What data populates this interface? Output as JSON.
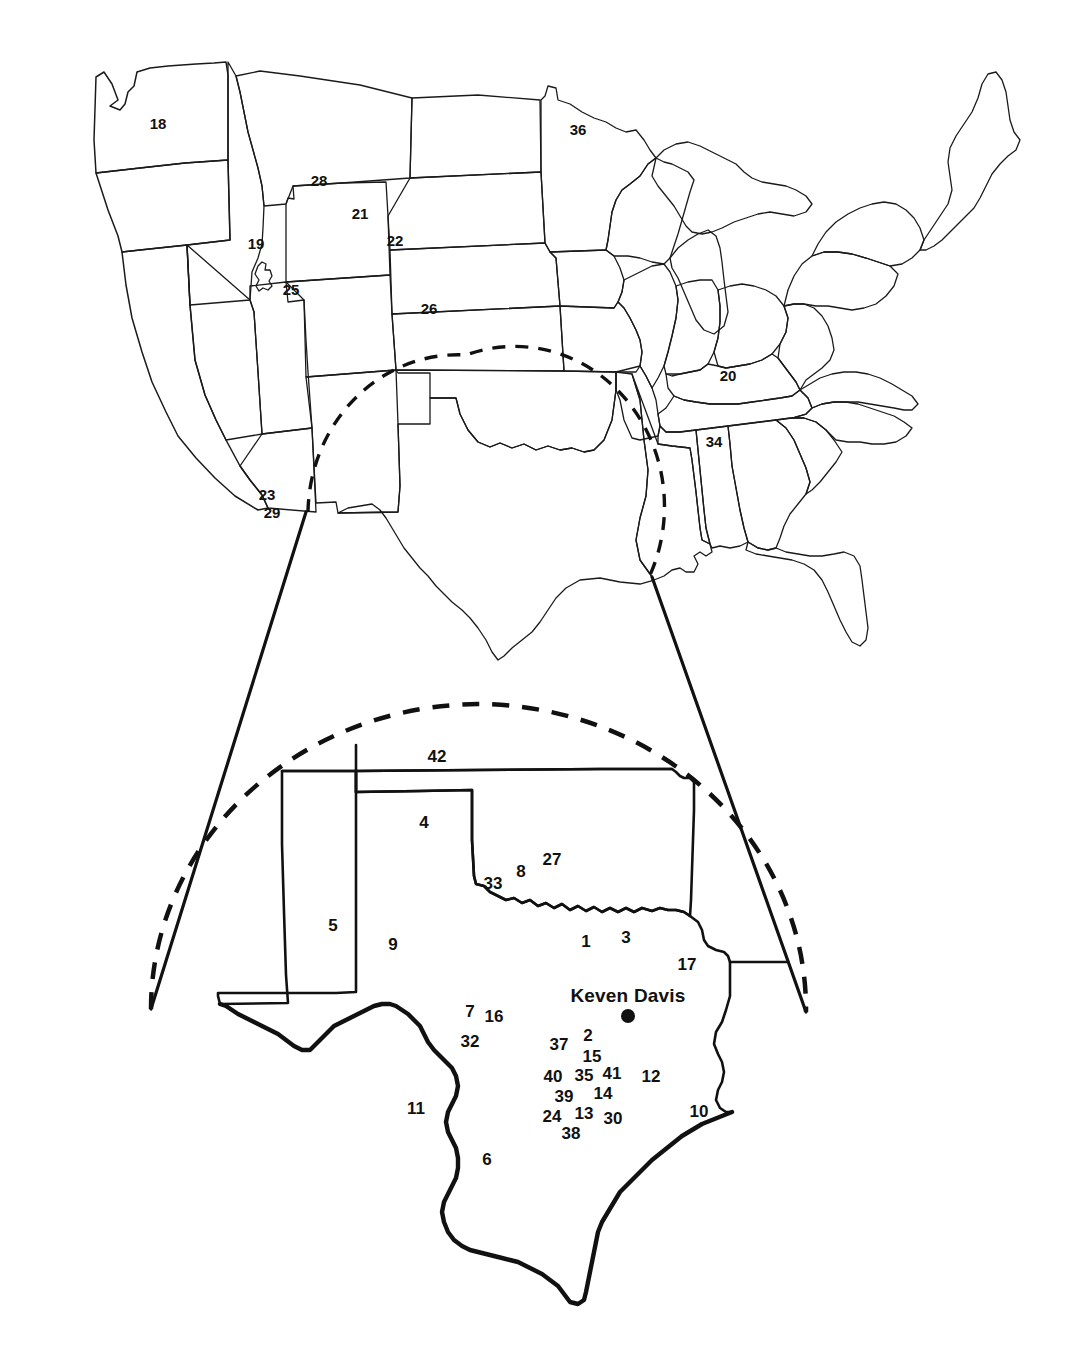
{
  "figure": {
    "kind": "locator-map",
    "line_color": "#111111",
    "background_color": "#ffffff"
  },
  "site_marker": {
    "name": "Keven Davis",
    "x": 628,
    "y": 1016,
    "radius": 7
  },
  "main_map_labels": [
    {
      "text": "18",
      "x": 158,
      "y": 123
    },
    {
      "text": "28",
      "x": 319,
      "y": 180
    },
    {
      "text": "36",
      "x": 578,
      "y": 129
    },
    {
      "text": "21",
      "x": 360,
      "y": 213
    },
    {
      "text": "19",
      "x": 256,
      "y": 243
    },
    {
      "text": "22",
      "x": 395,
      "y": 240
    },
    {
      "text": "25",
      "x": 291,
      "y": 289
    },
    {
      "text": "26",
      "x": 429,
      "y": 308
    },
    {
      "text": "20",
      "x": 728,
      "y": 375
    },
    {
      "text": "34",
      "x": 714,
      "y": 441
    },
    {
      "text": "23",
      "x": 267,
      "y": 494
    },
    {
      "text": "29",
      "x": 272,
      "y": 512
    }
  ],
  "inset_map_labels": [
    {
      "text": "42",
      "x": 437,
      "y": 756
    },
    {
      "text": "4",
      "x": 424,
      "y": 822
    },
    {
      "text": "27",
      "x": 552,
      "y": 859
    },
    {
      "text": "8",
      "x": 521,
      "y": 871
    },
    {
      "text": "33",
      "x": 493,
      "y": 883
    },
    {
      "text": "5",
      "x": 333,
      "y": 925
    },
    {
      "text": "9",
      "x": 393,
      "y": 944
    },
    {
      "text": "1",
      "x": 586,
      "y": 941
    },
    {
      "text": "3",
      "x": 626,
      "y": 937
    },
    {
      "text": "17",
      "x": 687,
      "y": 964
    },
    {
      "text": "7",
      "x": 470,
      "y": 1011
    },
    {
      "text": "16",
      "x": 494,
      "y": 1016
    },
    {
      "text": "32",
      "x": 470,
      "y": 1041
    },
    {
      "text": "37",
      "x": 559,
      "y": 1044
    },
    {
      "text": "2",
      "x": 588,
      "y": 1035
    },
    {
      "text": "15",
      "x": 592,
      "y": 1056
    },
    {
      "text": "40",
      "x": 553,
      "y": 1076
    },
    {
      "text": "35",
      "x": 584,
      "y": 1075
    },
    {
      "text": "41",
      "x": 612,
      "y": 1073
    },
    {
      "text": "12",
      "x": 651,
      "y": 1076
    },
    {
      "text": "39",
      "x": 564,
      "y": 1096
    },
    {
      "text": "14",
      "x": 603,
      "y": 1093
    },
    {
      "text": "24",
      "x": 552,
      "y": 1116
    },
    {
      "text": "13",
      "x": 584,
      "y": 1113
    },
    {
      "text": "30",
      "x": 613,
      "y": 1118
    },
    {
      "text": "10",
      "x": 699,
      "y": 1111
    },
    {
      "text": "38",
      "x": 571,
      "y": 1133
    },
    {
      "text": "11",
      "x": 416,
      "y": 1108
    },
    {
      "text": "6",
      "x": 487,
      "y": 1159
    }
  ]
}
